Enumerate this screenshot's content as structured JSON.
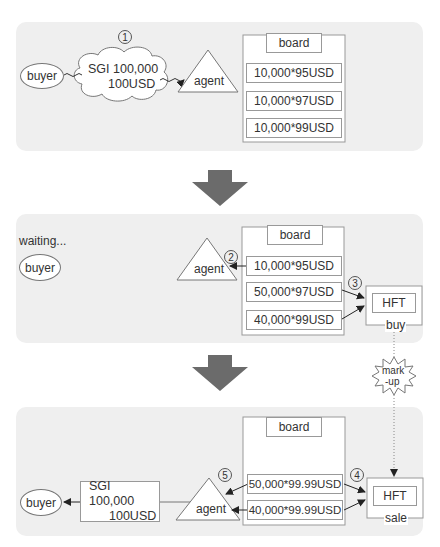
{
  "stage1": {
    "step": "1",
    "buyer": "buyer",
    "order_line1": "SGI 100,000",
    "order_line2": "100USD",
    "agent": "agent",
    "board": {
      "title": "board",
      "rows": [
        "10,000*95USD",
        "10,000*97USD",
        "10,000*99USD"
      ]
    }
  },
  "stage2": {
    "status": "waiting...",
    "buyer": "buyer",
    "agent": "agent",
    "step_agent": "2",
    "step_hft": "3",
    "board": {
      "title": "board",
      "rows": [
        "10,000*95USD",
        "50,000*97USD",
        "40,000*99USD"
      ]
    },
    "hft": {
      "label": "HFT",
      "action": "buy"
    }
  },
  "markup": {
    "line1": "mark",
    "line2": "-up"
  },
  "stage3": {
    "buyer": "buyer",
    "result_line1": "SGI 100,000",
    "result_line2": "100USD",
    "agent": "agent",
    "step_agent": "5",
    "step_hft": "4",
    "board": {
      "title": "board",
      "rows": [
        "50,000*99.99USD",
        "40,000*99.99USD"
      ]
    },
    "hft": {
      "label": "HFT",
      "action": "sale"
    }
  },
  "colors": {
    "panel": "#efefef",
    "arrow": "#6b6b6b",
    "stroke": "#999999"
  }
}
